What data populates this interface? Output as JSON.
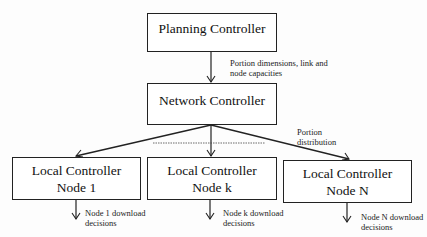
{
  "diagram": {
    "nodes": [
      {
        "id": "planning",
        "label": "Planning Controller"
      },
      {
        "id": "network",
        "label": "Network Controller"
      },
      {
        "id": "local1",
        "line1": "Local Controller",
        "line2": "Node 1"
      },
      {
        "id": "localk",
        "line1": "Local Controller",
        "line2": "Node k"
      },
      {
        "id": "localN",
        "line1": "Local Controller",
        "line2": "Node N"
      }
    ],
    "edge_labels": {
      "planning_to_network": {
        "line1": "Portion dimensions, link and",
        "line2": "node capacities"
      },
      "network_to_local": {
        "line1": "Portion",
        "line2": "distribution"
      },
      "local1_out": {
        "line1": "Node 1 download",
        "line2": "decisions"
      },
      "localk_out": {
        "line1": "Node k download",
        "line2": "decisions"
      },
      "localN_out": {
        "line1": "Node N download",
        "line2": "decisions"
      }
    },
    "colors": {
      "line": "#222222",
      "background": "#fdfdfd"
    }
  }
}
